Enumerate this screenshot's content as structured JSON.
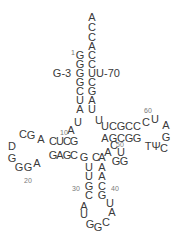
{
  "colors": {
    "text": "#3a3a3a",
    "numbers": "#7a7a7a",
    "background": "#ffffff"
  },
  "acceptor_tail": [
    "A",
    "C",
    "C",
    "A"
  ],
  "acceptor_stem": {
    "five_prime": [
      "G",
      "G",
      "G",
      "G",
      "C",
      "U",
      "A"
    ],
    "three_prime": [
      "C",
      "C",
      "U",
      "C",
      "G",
      "A",
      "U"
    ]
  },
  "labels": {
    "pos1": "1",
    "mutation_3": "G-3",
    "mutation_70": "U-70"
  },
  "junction_8_9": [
    "U",
    "A"
  ],
  "d_stem": {
    "top": [
      "C",
      "U",
      "C",
      "G"
    ],
    "bottom": [
      "G",
      "A",
      "G",
      "C"
    ]
  },
  "d_loop": [
    "A",
    "G",
    "C",
    "D",
    "G",
    "G",
    "G",
    "A"
  ],
  "variable_and_anticodon_stem_left": [
    "G",
    "C",
    "C",
    "U",
    "U",
    "G",
    "C"
  ],
  "anticodon_stem": {
    "five_prime": [
      "G",
      "U",
      "U",
      "G",
      "C"
    ],
    "three_prime": [
      "A",
      "A",
      "A",
      "C",
      "G"
    ]
  },
  "anticodon_loop": [
    "A",
    "U",
    "G",
    "G",
    "C",
    "A",
    "U"
  ],
  "variable_loop": [
    "A",
    "C",
    "U",
    "G",
    "G"
  ],
  "t_stem": {
    "top": [
      "U",
      "C",
      "G",
      "C",
      "C"
    ],
    "bottom": [
      "A",
      "G",
      "C",
      "G",
      "G"
    ]
  },
  "t_loop": [
    "C",
    "U",
    "A",
    "G",
    "C",
    "Ψ",
    "T"
  ],
  "position_numbers": {
    "n10": "10",
    "n20": "20",
    "n30": "30",
    "n40": "40",
    "n50": "50",
    "n60": "60"
  }
}
